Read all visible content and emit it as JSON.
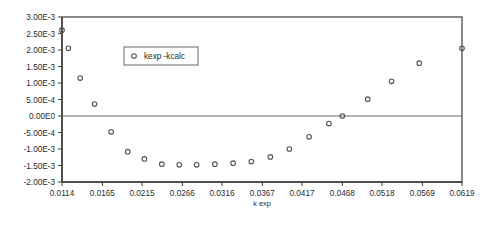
{
  "chart_data": {
    "type": "scatter",
    "title": "",
    "xlabel": "k exp",
    "ylabel": "",
    "grid": false,
    "legend_position": "inside-top-left",
    "xlim": [
      0.0114,
      0.0619
    ],
    "ylim": [
      -0.002,
      0.003
    ],
    "xticks": [
      "0.0114",
      "0.0165",
      "0.0215",
      "0.0266",
      "0.0316",
      "0.0367",
      "0.0417",
      "0.0468",
      "0.0518",
      "0.0569",
      "0.0619"
    ],
    "xtick_values": [
      0.0114,
      0.0165,
      0.0215,
      0.0266,
      0.0316,
      0.0367,
      0.0417,
      0.0468,
      0.0518,
      0.0569,
      0.0619
    ],
    "yticks": [
      "3.00E-3",
      "2.50E-3",
      "2.00E-3",
      "1.50E-3",
      "1.00E-3",
      "5.00E-4",
      "0.00E0",
      "-5.00E-4",
      "-1.00E-3",
      "-1.50E-3",
      "-2.00E-3"
    ],
    "ytick_values": [
      0.003,
      0.0025,
      0.002,
      0.0015,
      0.001,
      0.0005,
      0,
      -0.0005,
      -0.001,
      -0.0015,
      -0.002
    ],
    "series": [
      {
        "name": "kexp -kcalc",
        "marker": "open-circle",
        "color": "#555555",
        "x": [
          0.0114,
          0.0122,
          0.0137,
          0.0155,
          0.0176,
          0.0197,
          0.0218,
          0.024,
          0.0262,
          0.0284,
          0.0307,
          0.033,
          0.0353,
          0.0377,
          0.0401,
          0.0426,
          0.0451,
          0.0468,
          0.05,
          0.053,
          0.0565,
          0.0619
        ],
        "y": [
          0.0026,
          0.00205,
          0.00115,
          0.00036,
          -0.00048,
          -0.00108,
          -0.0013,
          -0.00146,
          -0.00148,
          -0.00148,
          -0.00146,
          -0.00143,
          -0.00138,
          -0.00124,
          -0.001,
          -0.00063,
          -0.00023,
          0.0,
          0.00051,
          0.00105,
          0.0016,
          0.00205
        ]
      }
    ],
    "legend": [
      {
        "label": "kexp -kcalc",
        "marker": "open-circle"
      }
    ]
  },
  "plot_geometry": {
    "left": 62,
    "right": 462,
    "top": 17,
    "bottom": 182
  },
  "legend_geometry": {
    "x": 124,
    "y": 47,
    "width": 74,
    "height": 18
  }
}
